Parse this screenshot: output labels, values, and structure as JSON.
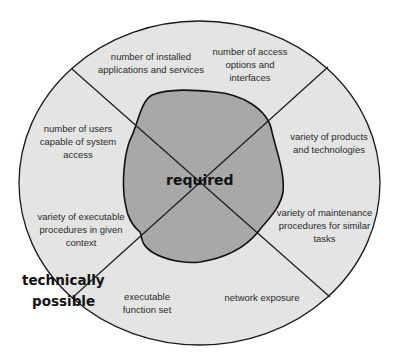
{
  "diagram": {
    "center_label": "required",
    "outer_label_line1": "technically",
    "outer_label_line2": "possible",
    "segments": [
      {
        "position": "top-left",
        "text": "number of installed applications and services"
      },
      {
        "position": "top-right",
        "text": "number of access options and interfaces"
      },
      {
        "position": "right-upper",
        "text": "variety of products and technologies"
      },
      {
        "position": "right-lower",
        "text": "variety of maintenance procedures for similar tasks"
      },
      {
        "position": "bottom-right",
        "text": "network exposure"
      },
      {
        "position": "bottom-left",
        "text": "executable function set"
      },
      {
        "position": "left-lower",
        "text": "variety of executable procedures in given context"
      },
      {
        "position": "left-upper",
        "text": "number of users capable of system access"
      }
    ],
    "colors": {
      "outer_fill": "#e4e4e4",
      "inner_fill": "#a9a9a9",
      "stroke": "#1a1a1a",
      "background": "#ffffff"
    }
  }
}
